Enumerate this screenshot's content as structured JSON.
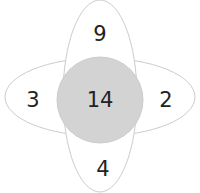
{
  "diagram": {
    "type": "flower-venn",
    "center": {
      "value": "14",
      "fill": "#d3d3d3"
    },
    "petals": {
      "top": "9",
      "left": "3",
      "right": "2",
      "bottom": "4"
    },
    "stroke_color": "#cccccc",
    "text_color": "#222222"
  }
}
